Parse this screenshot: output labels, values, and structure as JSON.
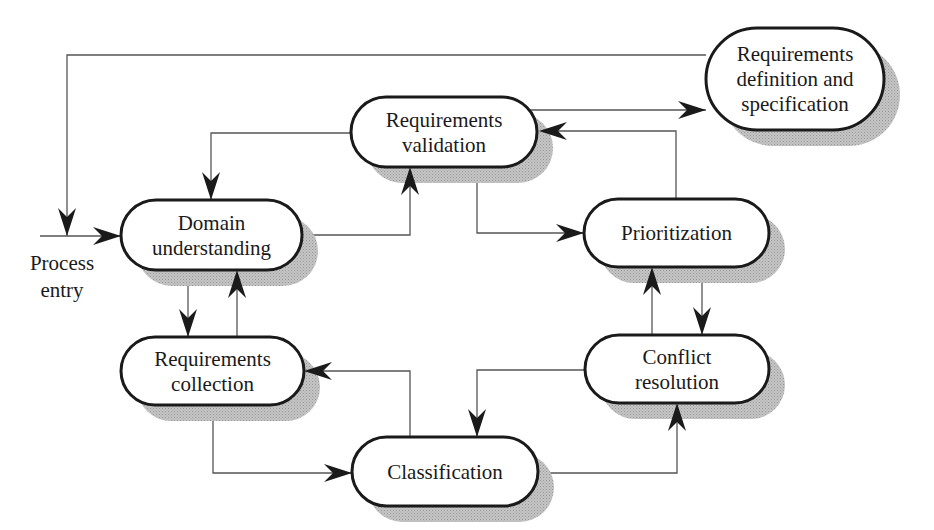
{
  "nodes": [
    {
      "id": "validation",
      "lines": [
        "Requirements",
        "validation"
      ]
    },
    {
      "id": "definition",
      "lines": [
        "Requirements",
        "definition and",
        "specification"
      ]
    },
    {
      "id": "domain",
      "lines": [
        "Domain",
        "understanding"
      ]
    },
    {
      "id": "prioritization",
      "lines": [
        "Prioritization"
      ]
    },
    {
      "id": "collection",
      "lines": [
        "Requirements",
        "collection"
      ]
    },
    {
      "id": "conflict",
      "lines": [
        "Conflict",
        "resolution"
      ]
    },
    {
      "id": "classification",
      "lines": [
        "Classification"
      ]
    }
  ],
  "entry_label": [
    "Process",
    "entry"
  ],
  "edges": [
    {
      "from": "entry",
      "to": "domain"
    },
    {
      "from": "definition",
      "to": "domain"
    },
    {
      "from": "validation",
      "to": "domain"
    },
    {
      "from": "domain",
      "to": "validation"
    },
    {
      "from": "validation",
      "to": "definition"
    },
    {
      "from": "validation",
      "to": "prioritization"
    },
    {
      "from": "prioritization",
      "to": "validation"
    },
    {
      "from": "domain",
      "to": "collection"
    },
    {
      "from": "collection",
      "to": "domain"
    },
    {
      "from": "prioritization",
      "to": "conflict"
    },
    {
      "from": "conflict",
      "to": "prioritization"
    },
    {
      "from": "classification",
      "to": "collection"
    },
    {
      "from": "collection",
      "to": "classification"
    },
    {
      "from": "conflict",
      "to": "classification"
    },
    {
      "from": "classification",
      "to": "conflict"
    }
  ],
  "colors": {
    "stroke": "#1a1a1a",
    "edge": "#555555",
    "shadow": "#b8b8b8"
  }
}
